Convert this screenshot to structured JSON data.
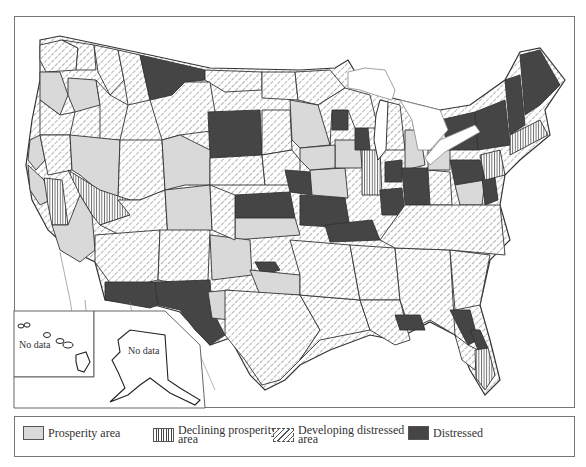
{
  "map": {
    "title": "",
    "inset_labels": {
      "hawaii": "No data",
      "alaska": "No data"
    },
    "colors": {
      "prosperity": "#d9d9d9",
      "declining": "#ffffff",
      "developing": "#ffffff",
      "distressed": "#454545",
      "border": "#333333",
      "water_line": "#888888"
    },
    "regions": [
      {
        "id": "wa-west",
        "category": "developing",
        "points": "40,45 62,40 78,48 76,70 46,72 40,60"
      },
      {
        "id": "wa-east",
        "category": "developing",
        "points": "62,40 94,45 96,70 76,70 78,48"
      },
      {
        "id": "id-north",
        "category": "developing",
        "points": "94,45 118,50 124,80 110,95 98,72"
      },
      {
        "id": "mt-west",
        "category": "developing",
        "points": "118,50 140,55 150,100 128,105 124,80"
      },
      {
        "id": "mt-north",
        "category": "distressed",
        "points": "140,55 205,70 205,80 185,82 172,95 150,100"
      },
      {
        "id": "nd-west",
        "category": "developing",
        "points": "205,70 262,72 262,90 225,92 205,80"
      },
      {
        "id": "nd-east",
        "category": "developing",
        "points": "262,72 295,72 298,100 262,98"
      },
      {
        "id": "mn-north",
        "category": "developing",
        "points": "295,72 330,70 345,88 318,105 298,100"
      },
      {
        "id": "or-west",
        "category": "prosperity",
        "points": "40,72 60,72 68,95 60,115 40,100"
      },
      {
        "id": "or-mid",
        "category": "prosperity",
        "points": "68,78 96,80 100,105 75,112 68,95"
      },
      {
        "id": "or-south",
        "category": "developing",
        "points": "40,100 60,115 75,112 70,135 40,135"
      },
      {
        "id": "id-mid",
        "category": "developing",
        "points": "96,80 110,95 128,105 120,140 100,140 100,105"
      },
      {
        "id": "mt-south",
        "category": "developing",
        "points": "150,100 172,95 185,82 210,82 218,130 180,135 162,140"
      },
      {
        "id": "sd-nw",
        "category": "distressed",
        "points": "208,112 260,110 262,155 210,158"
      },
      {
        "id": "sd-east",
        "category": "developing",
        "points": "262,110 290,110 292,150 262,155"
      },
      {
        "id": "mn-south",
        "category": "prosperity",
        "points": "290,100 318,105 328,115 330,145 300,148 292,140"
      },
      {
        "id": "wi-nw",
        "category": "distressed",
        "points": "332,110 348,110 348,130 332,130"
      },
      {
        "id": "ca-north",
        "category": "prosperity",
        "points": "30,140 40,135 45,160 36,170 28,160"
      },
      {
        "id": "ca-nmid",
        "category": "developing",
        "points": "40,135 70,135 72,170 48,175 45,160"
      },
      {
        "id": "nv-north",
        "category": "prosperity",
        "points": "70,135 120,140 118,200 98,190 80,175 72,170"
      },
      {
        "id": "ut-north",
        "category": "developing",
        "points": "120,140 162,140 165,190 140,200 118,200"
      },
      {
        "id": "wy",
        "category": "prosperity",
        "points": "162,140 180,135 210,150 210,185 185,185 165,190"
      },
      {
        "id": "ne-north",
        "category": "developing",
        "points": "210,158 262,155 265,185 210,185"
      },
      {
        "id": "ia-west",
        "category": "developing",
        "points": "262,155 292,150 300,160 300,185 265,185"
      },
      {
        "id": "ca-bay",
        "category": "prosperity",
        "points": "28,165 44,180 50,200 40,205 30,190"
      },
      {
        "id": "ca-central",
        "category": "declining",
        "points": "44,178 62,180 68,225 52,225 48,205"
      },
      {
        "id": "nv-south",
        "category": "declining",
        "points": "68,170 100,190 130,200 130,215 100,225 92,215 80,195"
      },
      {
        "id": "ca-south",
        "category": "prosperity",
        "points": "52,225 68,225 80,195 92,215 95,250 80,262 60,250"
      },
      {
        "id": "ut-south",
        "category": "developing",
        "points": "118,200 140,200 165,190 168,240 130,240 100,225 130,215"
      },
      {
        "id": "co-west",
        "category": "prosperity",
        "points": "165,190 210,185 212,230 168,240"
      },
      {
        "id": "ks-ne",
        "category": "distressed",
        "points": "235,195 290,192 295,218 235,218"
      },
      {
        "id": "mo-west",
        "category": "distressed",
        "points": "285,170 310,172 312,195 290,192"
      },
      {
        "id": "ks-south",
        "category": "prosperity",
        "points": "235,218 295,218 300,235 235,240"
      },
      {
        "id": "az-west",
        "category": "developing",
        "points": "95,235 160,230 158,280 115,290 95,262"
      },
      {
        "id": "nm-west",
        "category": "developing",
        "points": "160,230 210,230 208,280 185,285 158,280"
      },
      {
        "id": "nm-east",
        "category": "prosperity",
        "points": "210,235 250,240 252,275 212,280"
      },
      {
        "id": "az-south",
        "category": "distressed",
        "points": "105,282 155,282 158,305 150,308 105,300"
      },
      {
        "id": "tx-west",
        "category": "distressed",
        "points": "155,282 210,280 212,310 225,335 210,345 195,330 180,310 158,305"
      },
      {
        "id": "ok-ne",
        "category": "distressed",
        "points": "255,262 275,262 280,270 262,275"
      },
      {
        "id": "tx-panhandle",
        "category": "prosperity",
        "points": "250,270 300,275 300,295 260,295"
      },
      {
        "id": "tx-pecos",
        "category": "prosperity",
        "points": "208,292 230,290 230,320 212,318"
      },
      {
        "id": "tx-central",
        "category": "developing",
        "points": "225,290 300,295 320,330 300,360 280,380 262,385 245,360 225,335"
      },
      {
        "id": "tx-east",
        "category": "developing",
        "points": "300,295 360,300 370,330 320,340 300,360 320,330"
      },
      {
        "id": "ok-east",
        "category": "developing",
        "points": "290,240 350,245 360,300 300,295 300,275"
      },
      {
        "id": "ar",
        "category": "developing",
        "points": "350,245 395,248 400,300 360,300"
      },
      {
        "id": "la",
        "category": "developing",
        "points": "360,300 400,300 410,340 395,345 370,330"
      },
      {
        "id": "ms-al",
        "category": "developing",
        "points": "395,248 450,250 455,335 430,320 410,330 400,300"
      },
      {
        "id": "fl-panhandle",
        "category": "distressed",
        "points": "395,315 420,315 425,330 400,330"
      },
      {
        "id": "ga",
        "category": "developing",
        "points": "450,250 490,255 480,305 455,310"
      },
      {
        "id": "fl-north",
        "category": "distressed",
        "points": "450,310 470,310 478,340 468,345 460,330"
      },
      {
        "id": "fl-east",
        "category": "distressed",
        "points": "470,330 480,330 488,348 478,350"
      },
      {
        "id": "fl-central",
        "category": "developing",
        "points": "455,335 468,345 478,350 475,370 462,360"
      },
      {
        "id": "fl-south",
        "category": "declining",
        "points": "475,350 488,348 495,375 485,390 476,378"
      },
      {
        "id": "ne-ks-mid",
        "category": "developing",
        "points": "210,185 235,195 235,240 212,230"
      },
      {
        "id": "mo-east",
        "category": "distressed",
        "points": "300,195 345,198 350,228 300,225"
      },
      {
        "id": "ky-tn",
        "category": "distressed",
        "points": "325,225 372,220 380,240 330,242"
      },
      {
        "id": "il-south",
        "category": "prosperity",
        "points": "310,170 345,168 348,198 312,195"
      },
      {
        "id": "il-north",
        "category": "prosperity",
        "points": "335,140 360,140 362,168 335,168"
      },
      {
        "id": "wi-east",
        "category": "distressed",
        "points": "355,128 368,128 370,150 355,150"
      },
      {
        "id": "in",
        "category": "declining",
        "points": "362,150 380,150 382,195 362,195"
      },
      {
        "id": "mi-lower",
        "category": "developing",
        "points": "380,100 400,105 405,150 385,150"
      },
      {
        "id": "mi-east",
        "category": "prosperity",
        "points": "405,130 420,130 425,165 405,170"
      },
      {
        "id": "oh-west",
        "category": "distressed",
        "points": "385,162 402,160 402,182 385,182"
      },
      {
        "id": "oh-east",
        "category": "distressed",
        "points": "402,168 428,168 430,205 405,205"
      },
      {
        "id": "ky-east",
        "category": "distressed",
        "points": "380,190 402,188 405,215 382,215"
      },
      {
        "id": "wv",
        "category": "developing",
        "points": "428,170 450,172 452,205 430,205"
      },
      {
        "id": "pa-west",
        "category": "prosperity",
        "points": "428,150 450,150 450,170 428,170"
      },
      {
        "id": "pa-east",
        "category": "distressed",
        "points": "450,160 480,160 485,180 455,185"
      },
      {
        "id": "md",
        "category": "prosperity",
        "points": "455,185 485,180 482,205 460,205"
      },
      {
        "id": "de",
        "category": "distressed",
        "points": "482,178 495,178 498,200 485,205"
      },
      {
        "id": "va-nc",
        "category": "developing",
        "points": "405,205 500,205 505,255 450,250 395,248 380,240"
      },
      {
        "id": "ny-west",
        "category": "distressed",
        "points": "440,120 475,112 478,150 450,150"
      },
      {
        "id": "ny-east",
        "category": "distressed",
        "points": "475,112 505,100 510,145 478,150"
      },
      {
        "id": "vt-nh",
        "category": "distressed",
        "points": "505,80 520,75 525,125 510,135"
      },
      {
        "id": "me",
        "category": "distressed",
        "points": "520,55 540,50 560,85 540,105 525,115"
      },
      {
        "id": "ma-ct",
        "category": "declining",
        "points": "510,135 540,120 548,135 510,155"
      },
      {
        "id": "nj",
        "category": "declining",
        "points": "480,155 500,150 505,175 485,180"
      },
      {
        "id": "wi-west",
        "category": "developing",
        "points": "318,105 345,88 370,95 378,128 355,128 348,110 332,110 330,145"
      },
      {
        "id": "ia-east",
        "category": "prosperity",
        "points": "300,148 335,145 335,168 310,170 300,160"
      }
    ]
  },
  "legend": {
    "items": [
      {
        "key": "prosperity",
        "label": "Prosperity area"
      },
      {
        "key": "declining",
        "label": "Declining prosperity\narea"
      },
      {
        "key": "developing",
        "label": "Developing distressed\narea"
      },
      {
        "key": "distressed",
        "label": "Distressed"
      }
    ]
  }
}
